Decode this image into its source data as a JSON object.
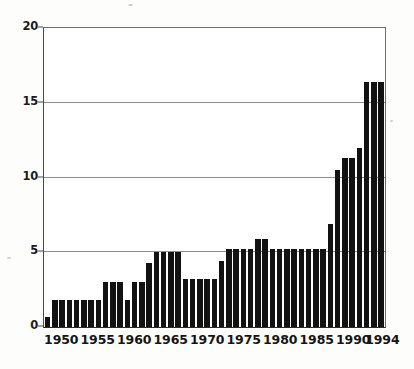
{
  "chart_data": {
    "type": "bar",
    "title": "",
    "subtitle": "",
    "xlabel": "",
    "ylabel": "",
    "ylim": [
      0,
      20
    ],
    "yticks": [
      0,
      5,
      10,
      15,
      20
    ],
    "ytick_labels": [
      "0",
      "5",
      "10",
      "15",
      "20"
    ],
    "grid": true,
    "gridlines_at": [
      5,
      10,
      15,
      20
    ],
    "legend": "none",
    "bar_color": "#121212",
    "axis_color": "#2b2b2b",
    "grid_color": "#8d8d8d",
    "xtick_labels": [
      "1950",
      "1955",
      "1960",
      "1965",
      "1970",
      "1975",
      "1980",
      "1985",
      "1990",
      "1994"
    ],
    "xticks": [
      1950,
      1955,
      1960,
      1965,
      1970,
      1975,
      1980,
      1985,
      1990,
      1994
    ],
    "categories": [
      "1948",
      "1949",
      "1950",
      "1951",
      "1952",
      "1953",
      "1954",
      "1955",
      "1956",
      "1957",
      "1958",
      "1959",
      "1960",
      "1961",
      "1962",
      "1963",
      "1964",
      "1965",
      "1966",
      "1967",
      "1968",
      "1969",
      "1970",
      "1971",
      "1972",
      "1973",
      "1974",
      "1975",
      "1976",
      "1977",
      "1978",
      "1979",
      "1980",
      "1981",
      "1982",
      "1983",
      "1984",
      "1985",
      "1986",
      "1987",
      "1988",
      "1989",
      "1990",
      "1991",
      "1992",
      "1993",
      "1994"
    ],
    "values": [
      0.7,
      1.8,
      1.8,
      1.8,
      1.8,
      1.8,
      1.8,
      1.8,
      3.0,
      3.0,
      3.0,
      1.8,
      3.0,
      3.0,
      4.3,
      5.0,
      5.0,
      5.0,
      5.0,
      3.2,
      3.2,
      3.2,
      3.2,
      3.2,
      4.4,
      5.2,
      5.2,
      5.2,
      5.2,
      5.9,
      5.9,
      5.2,
      5.2,
      5.2,
      5.2,
      5.2,
      5.2,
      5.2,
      5.2,
      6.9,
      10.5,
      11.3,
      11.3,
      12.0,
      16.4,
      16.4,
      16.4
    ]
  }
}
